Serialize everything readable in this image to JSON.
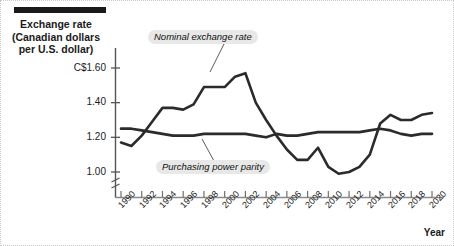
{
  "figure": {
    "y_axis_title": "Exchange rate\n(Canadian dollars\nper U.S. dollar)",
    "y_axis_title_line1": "Exchange rate",
    "y_axis_title_line2": "(Canadian dollars",
    "y_axis_title_line3": "per U.S. dollar)",
    "x_axis_title": "Year",
    "annotation_nominal": "Nominal exchange rate",
    "annotation_ppp": "Purchasing power parity",
    "line_color": "#2b2b2b",
    "axis_color": "#555555",
    "annotation_bg": "#e8e8e8",
    "title_bar_color": "#1a1a1a"
  },
  "chart_data": {
    "type": "line",
    "title": "",
    "xlabel": "Year",
    "ylabel": "Exchange rate (Canadian dollars per U.S. dollar)",
    "xlim": [
      1990,
      2020
    ],
    "ylim": [
      0.95,
      1.68
    ],
    "yticks": [
      1.0,
      1.2,
      1.4,
      1.6
    ],
    "ytick_labels": [
      "1.00",
      "1.20",
      "1.40",
      "C$1.60"
    ],
    "xticks": [
      1990,
      1992,
      1994,
      1996,
      1998,
      2000,
      2002,
      2004,
      2006,
      2008,
      2010,
      2012,
      2014,
      2016,
      2018,
      2020
    ],
    "xtick_labels": [
      "1990",
      "1992",
      "1994",
      "1996",
      "1998",
      "2000",
      "2002",
      "2004",
      "2006",
      "2008",
      "2010",
      "2012",
      "2014",
      "2016",
      "2018",
      "2020"
    ],
    "axis_break": true,
    "grid": false,
    "legend": "inline-annotations",
    "x": [
      1990,
      1991,
      1992,
      1993,
      1994,
      1995,
      1996,
      1997,
      1998,
      1999,
      2000,
      2001,
      2002,
      2003,
      2004,
      2005,
      2006,
      2007,
      2008,
      2009,
      2010,
      2011,
      2012,
      2013,
      2014,
      2015,
      2016,
      2017,
      2018,
      2019,
      2020
    ],
    "series": [
      {
        "name": "Nominal exchange rate",
        "values": [
          1.17,
          1.15,
          1.21,
          1.29,
          1.37,
          1.37,
          1.36,
          1.39,
          1.49,
          1.49,
          1.49,
          1.55,
          1.57,
          1.4,
          1.3,
          1.21,
          1.13,
          1.07,
          1.07,
          1.14,
          1.03,
          0.99,
          1.0,
          1.03,
          1.1,
          1.28,
          1.33,
          1.3,
          1.3,
          1.33,
          1.34
        ]
      },
      {
        "name": "Purchasing power parity",
        "values": [
          1.25,
          1.25,
          1.24,
          1.23,
          1.22,
          1.21,
          1.21,
          1.21,
          1.22,
          1.22,
          1.22,
          1.22,
          1.22,
          1.21,
          1.2,
          1.22,
          1.21,
          1.21,
          1.22,
          1.23,
          1.23,
          1.23,
          1.23,
          1.23,
          1.24,
          1.25,
          1.24,
          1.22,
          1.21,
          1.22,
          1.22
        ]
      }
    ]
  }
}
